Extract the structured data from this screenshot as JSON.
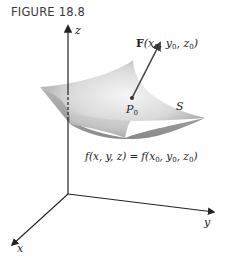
{
  "figure": {
    "title": "FIGURE 18.8"
  },
  "axes": {
    "x_label": "x",
    "y_label": "y",
    "z_label": "z"
  },
  "surface": {
    "label": "S",
    "point_label_base": "P",
    "point_label_sub": "0",
    "equation_lhs": "f(x, y, z)",
    "equation_eq": "=",
    "equation_rhs": "f(x",
    "equation_rhs_sub0": "0",
    "equation_rhs_y": ", y",
    "equation_rhs_sub1": "0",
    "equation_rhs_z": ", z",
    "equation_rhs_sub2": "0",
    "equation_rhs_close": ")"
  },
  "vector": {
    "bold_label": "F",
    "args_open": "(x",
    "sub0": "0",
    "y": ", y",
    "sub1": "0",
    "z": ", z",
    "sub2": "0",
    "close": ")"
  },
  "colors": {
    "axis": "#222222",
    "surface_light": "#f2f2f2",
    "surface_dark": "#8c8c8c",
    "vector": "#444444"
  }
}
